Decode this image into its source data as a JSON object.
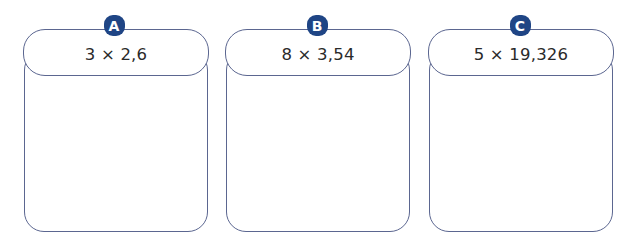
{
  "cards": [
    {
      "label": "A",
      "expression": "3 × 2,6"
    },
    {
      "label": "B",
      "expression": "8 × 3,54"
    },
    {
      "label": "C",
      "expression": "5 × 19,326"
    }
  ],
  "colors": {
    "badge": "#1f4585",
    "border": "#5b6690",
    "text": "#2a2a2a"
  }
}
